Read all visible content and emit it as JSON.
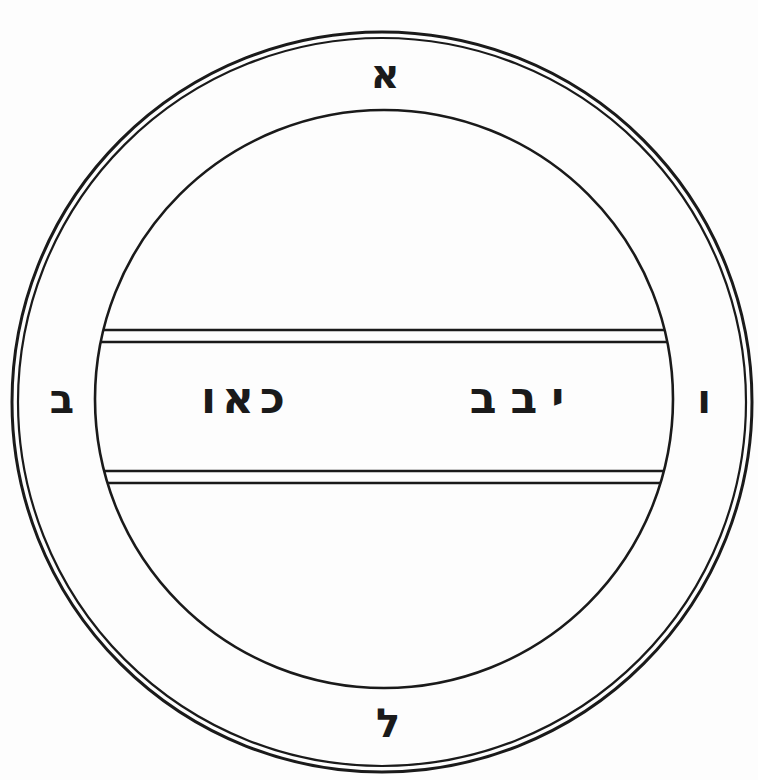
{
  "diagram": {
    "title": "",
    "type": "seal-diagram",
    "stroke_color": "#1a1a1a",
    "background": "#fdfdfd",
    "outer_ring_letters": {
      "top": "א",
      "left": "ב",
      "right": "ו",
      "bottom": "ל"
    },
    "band_text": {
      "left_word": "כאו",
      "right_word": "יבב"
    }
  }
}
